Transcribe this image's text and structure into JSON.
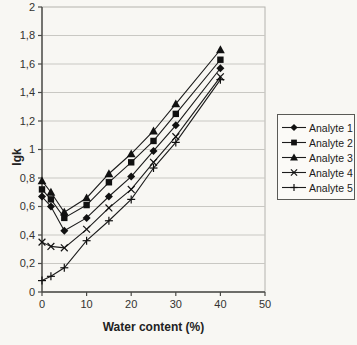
{
  "chart_data": {
    "type": "line",
    "title": "",
    "xlabel": "Water content (%)",
    "ylabel": "lgk",
    "xlim": [
      0,
      50
    ],
    "ylim": [
      0,
      2
    ],
    "x_ticks": [
      0,
      10,
      20,
      30,
      40,
      50
    ],
    "x_tick_labels": [
      "0",
      "10",
      "20",
      "30",
      "40",
      "50"
    ],
    "y_ticks": [
      0,
      0.2,
      0.4,
      0.6,
      0.8,
      1.0,
      1.2,
      1.4,
      1.6,
      1.8,
      2.0
    ],
    "y_tick_labels": [
      "0",
      "0,2",
      "0,4",
      "0,6",
      "0,8",
      "1",
      "1,2",
      "1,4",
      "1,6",
      "1,8",
      "2"
    ],
    "grid": "horizontal",
    "legend_position": "right",
    "x": [
      0,
      2,
      5,
      10,
      15,
      20,
      25,
      30,
      40
    ],
    "series": [
      {
        "name": "Analyte 1",
        "marker": "diamond",
        "values": [
          0.67,
          0.6,
          0.43,
          0.52,
          0.67,
          0.81,
          0.99,
          1.17,
          1.57
        ]
      },
      {
        "name": "Analyte 2",
        "marker": "square",
        "values": [
          0.72,
          0.65,
          0.52,
          0.61,
          0.77,
          0.91,
          1.06,
          1.25,
          1.63
        ]
      },
      {
        "name": "Analyte 3",
        "marker": "triangle",
        "values": [
          0.78,
          0.7,
          0.56,
          0.66,
          0.83,
          0.97,
          1.13,
          1.32,
          1.7
        ]
      },
      {
        "name": "Analyte 4",
        "marker": "x",
        "values": [
          0.35,
          0.32,
          0.31,
          0.44,
          0.59,
          0.72,
          0.91,
          1.09,
          1.51
        ]
      },
      {
        "name": "Analyte 5",
        "marker": "plus",
        "values": [
          0.08,
          0.11,
          0.17,
          0.36,
          0.5,
          0.65,
          0.87,
          1.05,
          1.49
        ]
      }
    ],
    "colors": {
      "line": "#1c1c1c",
      "marker": "#111111",
      "grid": "#c9c8c3",
      "plot_border": "#b4b3ae",
      "axis": "#4a4a47",
      "tick_text": "#333330"
    }
  }
}
